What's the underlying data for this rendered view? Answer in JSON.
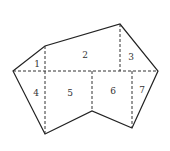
{
  "diagram": {
    "type": "polygon-partition",
    "outline_vertices": [
      [
        13,
        71
      ],
      [
        45,
        46
      ],
      [
        120,
        24
      ],
      [
        158,
        71
      ],
      [
        132,
        128
      ],
      [
        92,
        111
      ],
      [
        45,
        134
      ]
    ],
    "dashed_lines": [
      {
        "x1": 13,
        "y1": 71,
        "x2": 158,
        "y2": 71
      },
      {
        "x1": 45,
        "y1": 46,
        "x2": 45,
        "y2": 134
      },
      {
        "x1": 120,
        "y1": 24,
        "x2": 120,
        "y2": 71
      },
      {
        "x1": 92,
        "y1": 71,
        "x2": 92,
        "y2": 111
      },
      {
        "x1": 132,
        "y1": 71,
        "x2": 132,
        "y2": 128
      }
    ],
    "regions": [
      {
        "label": "1",
        "x": 37,
        "y": 67
      },
      {
        "label": "2",
        "x": 85,
        "y": 58
      },
      {
        "label": "3",
        "x": 131,
        "y": 60
      },
      {
        "label": "4",
        "x": 36,
        "y": 96
      },
      {
        "label": "5",
        "x": 70,
        "y": 96
      },
      {
        "label": "6",
        "x": 113,
        "y": 94
      },
      {
        "label": "7",
        "x": 142,
        "y": 93
      }
    ]
  }
}
